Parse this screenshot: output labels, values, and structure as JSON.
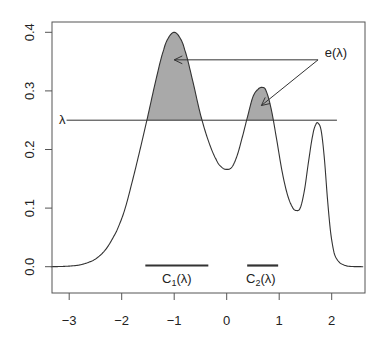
{
  "chart_data": {
    "type": "line",
    "title": "",
    "xlabel": "",
    "ylabel": "",
    "xlim": [
      -3.35,
      2.6
    ],
    "ylim": [
      -0.045,
      0.418
    ],
    "x_ticks": [
      -3,
      -2,
      -1,
      0,
      1,
      2
    ],
    "x_tick_labels": [
      "-3",
      "-2",
      "-1",
      "0",
      "1",
      "2"
    ],
    "y_ticks": [
      0.0,
      0.1,
      0.2,
      0.3,
      0.4
    ],
    "y_tick_labels": [
      "0.0",
      "0.1",
      "0.2",
      "0.3",
      "0.4"
    ],
    "grid": false,
    "legend": null,
    "series": [
      {
        "name": "density",
        "x": [
          -3.35,
          -3.0,
          -2.75,
          -2.5,
          -2.3,
          -2.1,
          -1.95,
          -1.8,
          -1.65,
          -1.5,
          -1.35,
          -1.2,
          -1.1,
          -1.0,
          -0.9,
          -0.8,
          -0.65,
          -0.5,
          -0.35,
          -0.2,
          -0.1,
          0.0,
          0.1,
          0.2,
          0.3,
          0.4,
          0.5,
          0.6,
          0.68,
          0.75,
          0.85,
          0.95,
          1.05,
          1.15,
          1.25,
          1.32,
          1.4,
          1.48,
          1.56,
          1.64,
          1.7,
          1.74,
          1.8,
          1.86,
          1.92,
          1.98,
          2.05,
          2.15,
          2.3,
          2.6
        ],
        "y": [
          0.0,
          0.001,
          0.004,
          0.013,
          0.03,
          0.06,
          0.095,
          0.145,
          0.2,
          0.258,
          0.318,
          0.37,
          0.392,
          0.4,
          0.392,
          0.37,
          0.318,
          0.26,
          0.215,
          0.183,
          0.17,
          0.166,
          0.17,
          0.19,
          0.222,
          0.257,
          0.29,
          0.303,
          0.306,
          0.3,
          0.268,
          0.218,
          0.165,
          0.125,
          0.102,
          0.096,
          0.1,
          0.13,
          0.18,
          0.225,
          0.243,
          0.245,
          0.232,
          0.185,
          0.115,
          0.058,
          0.022,
          0.007,
          0.001,
          0.0
        ]
      }
    ],
    "threshold": {
      "label": "λ",
      "y": 0.25,
      "x_from": -3.05,
      "x_to": 2.1
    },
    "shaded_regions": [
      {
        "name": "C1 excess",
        "x_from": -1.55,
        "x_to": -0.44,
        "color": "#a9a9a9"
      },
      {
        "name": "C2 excess",
        "x_from": 0.39,
        "x_to": 0.94,
        "color": "#a9a9a9"
      }
    ],
    "annotations": [
      {
        "text": "e(λ)",
        "x": 2.05,
        "y": 0.37
      },
      {
        "text": "C1(λ)",
        "x": -0.95,
        "y": -0.027,
        "bar_from": -1.55,
        "bar_to": -0.35,
        "bar_y": 0.001
      },
      {
        "text": "C2(λ)",
        "x": 0.65,
        "y": -0.027,
        "bar_from": 0.39,
        "bar_to": 0.98,
        "bar_y": 0.001
      }
    ],
    "arrows": [
      {
        "from": [
          1.74,
          0.353
        ],
        "to": [
          -1.0,
          0.353
        ]
      },
      {
        "from": [
          1.74,
          0.353
        ],
        "to": [
          0.66,
          0.275
        ]
      }
    ]
  },
  "labels": {
    "lambda": "λ",
    "e_label": "e(λ)",
    "c1_main": "C",
    "c1_sub": "1",
    "c1_tail": "(λ)",
    "c2_main": "C",
    "c2_sub": "2",
    "c2_tail": "(λ)"
  },
  "x_ticks": [
    {
      "label": "−3"
    },
    {
      "label": "−2"
    },
    {
      "label": "−1"
    },
    {
      "label": "0"
    },
    {
      "label": "1"
    },
    {
      "label": "2"
    }
  ],
  "y_ticks": [
    {
      "label": "0.0"
    },
    {
      "label": "0.1"
    },
    {
      "label": "0.2"
    },
    {
      "label": "0.3"
    },
    {
      "label": "0.4"
    }
  ],
  "colors": {
    "line": "#333333",
    "fill": "#a9a9a9",
    "axis": "#555555",
    "bar": "#333333"
  }
}
